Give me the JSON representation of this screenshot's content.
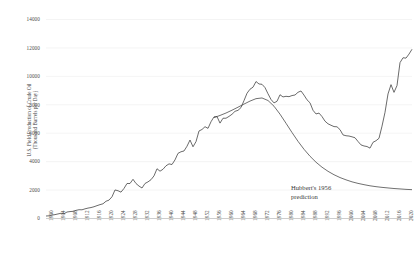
{
  "chart_data": {
    "type": "line",
    "title": "",
    "xlabel": "",
    "ylabel": "U.S. Field Production of Crude Oil",
    "ylabel_sub": "(Thousand Barrels per Day)",
    "ylim": [
      0,
      14000
    ],
    "xlim": [
      1900,
      2022
    ],
    "grid": "horizontal-light",
    "legend": "none",
    "ytick_labels": [
      "14000",
      "12000",
      "10000",
      "8000",
      "6000",
      "4000",
      "2000",
      "0"
    ],
    "ytick_values": [
      14000,
      12000,
      10000,
      8000,
      6000,
      4000,
      2000,
      0
    ],
    "xtick_labels": [
      "1900",
      "1904",
      "1908",
      "1912",
      "1916",
      "1920",
      "1924",
      "1928",
      "1932",
      "1936",
      "1940",
      "1944",
      "1948",
      "1952",
      "1956",
      "1960",
      "1964",
      "1968",
      "1972",
      "1976",
      "1980",
      "1984",
      "1988",
      "1992",
      "1996",
      "2000",
      "2004",
      "2008",
      "2012",
      "2016",
      "2020"
    ],
    "xtick_values": [
      1900,
      1904,
      1908,
      1912,
      1916,
      1920,
      1924,
      1928,
      1932,
      1936,
      1940,
      1944,
      1948,
      1952,
      1956,
      1960,
      1964,
      1968,
      1972,
      1976,
      1980,
      1984,
      1988,
      1992,
      1996,
      2000,
      2004,
      2008,
      2012,
      2016,
      2020
    ],
    "annotations": [
      {
        "text_line1": "Hubbert's 1956",
        "text_line2": "prediction",
        "x": 2000,
        "y": 2300
      }
    ],
    "series": [
      {
        "name": "U.S. Field Production of Crude Oil",
        "color": "#404040",
        "x": [
          1900,
          1901,
          1902,
          1903,
          1904,
          1905,
          1906,
          1907,
          1908,
          1909,
          1910,
          1911,
          1912,
          1913,
          1914,
          1915,
          1916,
          1917,
          1918,
          1919,
          1920,
          1921,
          1922,
          1923,
          1924,
          1925,
          1926,
          1927,
          1928,
          1929,
          1930,
          1931,
          1932,
          1933,
          1934,
          1935,
          1936,
          1937,
          1938,
          1939,
          1940,
          1941,
          1942,
          1943,
          1944,
          1945,
          1946,
          1947,
          1948,
          1949,
          1950,
          1951,
          1952,
          1953,
          1954,
          1955,
          1956,
          1957,
          1958,
          1959,
          1960,
          1961,
          1962,
          1963,
          1964,
          1965,
          1966,
          1967,
          1968,
          1969,
          1970,
          1971,
          1972,
          1973,
          1974,
          1975,
          1976,
          1977,
          1978,
          1979,
          1980,
          1981,
          1982,
          1983,
          1984,
          1985,
          1986,
          1987,
          1988,
          1989,
          1990,
          1991,
          1992,
          1993,
          1994,
          1995,
          1996,
          1997,
          1998,
          1999,
          2000,
          2001,
          2002,
          2003,
          2004,
          2005,
          2006,
          2007,
          2008,
          2009,
          2010,
          2011,
          2012,
          2013,
          2014,
          2015,
          2016,
          2017,
          2018,
          2019,
          2020,
          2021,
          2022
        ],
        "values": [
          174,
          190,
          238,
          273,
          321,
          369,
          336,
          455,
          487,
          505,
          573,
          617,
          612,
          680,
          733,
          770,
          827,
          904,
          976,
          1035,
          1214,
          1294,
          1529,
          2008,
          1953,
          1854,
          2117,
          2463,
          2463,
          2757,
          2460,
          2280,
          2145,
          2464,
          2578,
          2730,
          3000,
          3500,
          3327,
          3464,
          3707,
          3842,
          3799,
          4125,
          4584,
          4695,
          4750,
          5085,
          5520,
          5046,
          5407,
          6158,
          6263,
          6458,
          6342,
          6807,
          7151,
          7170,
          6710,
          7054,
          7055,
          7183,
          7332,
          7542,
          7610,
          7804,
          8295,
          8810,
          9096,
          9238,
          9637,
          9463,
          9441,
          9208,
          8774,
          8375,
          8132,
          8245,
          8707,
          8552,
          8597,
          8572,
          8649,
          8688,
          8879,
          8971,
          8680,
          8349,
          8140,
          7613,
          7355,
          7417,
          7171,
          6847,
          6662,
          6560,
          6465,
          6452,
          6252,
          5881,
          5822,
          5801,
          5746,
          5681,
          5419,
          5178,
          5102,
          5064,
          4950,
          5361,
          5471,
          5643,
          6497,
          7468,
          8763,
          9415,
          8875,
          9353,
          10964,
          11307,
          11283,
          11567,
          11907
        ]
      },
      {
        "name": "Hubbert's 1956 prediction",
        "color": "#404040",
        "x": [
          1956,
          1958,
          1960,
          1962,
          1964,
          1966,
          1968,
          1970,
          1972,
          1974,
          1976,
          1978,
          1980,
          1982,
          1984,
          1986,
          1988,
          1990,
          1992,
          1994,
          1996,
          1998,
          2000,
          2002,
          2004,
          2006,
          2008,
          2010,
          2012,
          2014,
          2016,
          2018,
          2020,
          2022
        ],
        "values": [
          7100,
          7250,
          7420,
          7620,
          7830,
          8050,
          8260,
          8430,
          8480,
          8300,
          7900,
          7340,
          6700,
          6050,
          5430,
          4870,
          4380,
          3960,
          3610,
          3320,
          3080,
          2880,
          2720,
          2580,
          2470,
          2380,
          2300,
          2240,
          2190,
          2150,
          2110,
          2080,
          2050,
          2030
        ]
      }
    ]
  }
}
